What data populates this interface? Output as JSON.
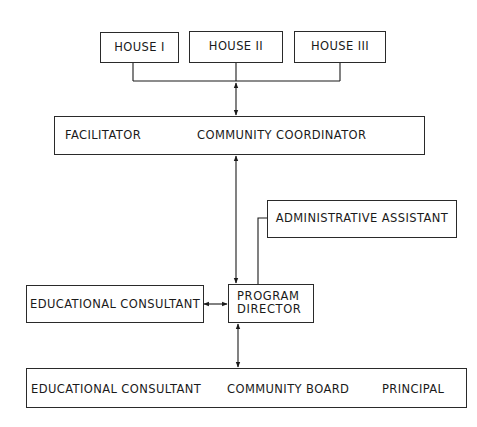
{
  "diagram": {
    "type": "organizational-chart",
    "houses": [
      {
        "label": "HOUSE I"
      },
      {
        "label": "HOUSE II"
      },
      {
        "label": "HOUSE III"
      }
    ],
    "coordination": {
      "left": "FACILITATOR",
      "right": "COMMUNITY COORDINATOR"
    },
    "administrative_assistant": "ADMINISTRATIVE ASSISTANT",
    "educational_consultant_side": "EDUCATIONAL CONSULTANT",
    "program_director": {
      "line1": "PROGRAM",
      "line2": "DIRECTOR"
    },
    "bottom": {
      "left": "EDUCATIONAL CONSULTANT",
      "center": "COMMUNITY BOARD",
      "right": "PRINCIPAL"
    },
    "edges": [
      {
        "from": "HOUSE I / HOUSE II / HOUSE III",
        "to": "FACILITATOR / COMMUNITY COORDINATOR",
        "type": "bidirectional"
      },
      {
        "from": "FACILITATOR",
        "to": "COMMUNITY COORDINATOR",
        "type": "bidirectional"
      },
      {
        "from": "FACILITATOR / COMMUNITY COORDINATOR",
        "to": "PROGRAM DIRECTOR",
        "type": "bidirectional"
      },
      {
        "from": "ADMINISTRATIVE ASSISTANT",
        "to": "PROGRAM DIRECTOR",
        "type": "line"
      },
      {
        "from": "EDUCATIONAL CONSULTANT",
        "to": "PROGRAM DIRECTOR",
        "type": "bidirectional"
      },
      {
        "from": "PROGRAM DIRECTOR",
        "to": "COMMUNITY BOARD",
        "type": "bidirectional"
      },
      {
        "from": "EDUCATIONAL CONSULTANT",
        "to": "COMMUNITY BOARD",
        "type": "bidirectional"
      },
      {
        "from": "COMMUNITY BOARD",
        "to": "PRINCIPAL",
        "type": "bidirectional"
      }
    ]
  }
}
